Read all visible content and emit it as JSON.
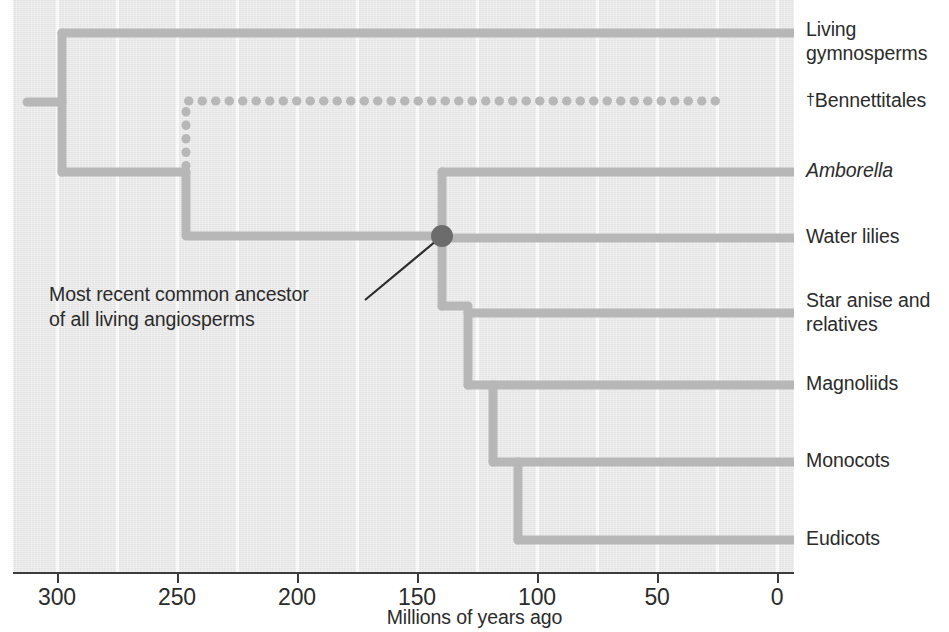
{
  "figure": {
    "type": "phylogenetic-tree-cladogram",
    "background_color": "#e9e9e9",
    "branch_color": "#b7b7b7",
    "node_color": "#6c6c6c",
    "text_color": "#2b2b2b"
  },
  "axis": {
    "title": "Millions of years ago",
    "direction": "right-to-left",
    "ticks": [
      {
        "label": "300",
        "value": 300,
        "x": 57
      },
      {
        "label": "250",
        "value": 250,
        "x": 177
      },
      {
        "label": "200",
        "value": 200,
        "x": 297
      },
      {
        "label": "150",
        "value": 150,
        "x": 417
      },
      {
        "label": "100",
        "value": 100,
        "x": 537
      },
      {
        "label": "50",
        "value": 50,
        "x": 657
      },
      {
        "label": "0",
        "value": 0,
        "x": 777
      }
    ],
    "gridline_x": [
      57,
      117,
      177,
      237,
      297,
      357,
      417,
      477,
      537,
      597,
      657,
      717,
      777
    ]
  },
  "taxa": [
    {
      "name": "Living gymnosperms",
      "lines": [
        "Living",
        "gymnosperms"
      ],
      "italic": false,
      "extinct": false,
      "label_top": 18,
      "tip_y": 33
    },
    {
      "name": "Bennettitales",
      "lines": [
        "Bennettitales"
      ],
      "italic": false,
      "extinct": true,
      "label_top": 88,
      "tip_y": 101
    },
    {
      "name": "Amborella",
      "lines": [
        "Amborella"
      ],
      "italic": true,
      "extinct": false,
      "label_top": 159,
      "tip_y": 172
    },
    {
      "name": "Water lilies",
      "lines": [
        "Water lilies"
      ],
      "italic": false,
      "extinct": false,
      "label_top": 225,
      "tip_y": 238
    },
    {
      "name": "Star anise and relatives",
      "lines": [
        "Star anise and",
        "relatives"
      ],
      "italic": false,
      "extinct": false,
      "label_top": 289,
      "tip_y": 313
    },
    {
      "name": "Magnoliids",
      "lines": [
        "Magnoliids"
      ],
      "italic": false,
      "extinct": false,
      "label_top": 372,
      "tip_y": 385
    },
    {
      "name": "Monocots",
      "lines": [
        "Monocots"
      ],
      "italic": false,
      "extinct": false,
      "label_top": 449,
      "tip_y": 462
    },
    {
      "name": "Eudicots",
      "lines": [
        "Eudicots"
      ],
      "italic": false,
      "extinct": false,
      "label_top": 527,
      "tip_y": 540
    }
  ],
  "annotation": {
    "text": "Most recent common ancestor of all living angiosperms",
    "line1": "Most recent common ancestor",
    "line2": "of all living angiosperms"
  },
  "node_marker": {
    "name": "most-recent-common-ancestor-of-living-angiosperms",
    "x": 429,
    "y": 236,
    "radius": 11,
    "age_mya": 155
  },
  "chart_data": {
    "type": "tree",
    "title": "",
    "xlabel": "Millions of years ago",
    "ylabel": "",
    "xlim": [
      330,
      0
    ],
    "grid": true,
    "legend": "none",
    "tip_labels": [
      "Living gymnosperms",
      "†Bennettitales",
      "Amborella",
      "Water lilies",
      "Star anise and relatives",
      "Magnoliids",
      "Monocots",
      "Eudicots"
    ],
    "nodes": [
      {
        "name": "root-split-seed-plants",
        "age_mya": 325,
        "children": [
          "Living gymnosperms",
          "angiosperm-bennettitales-clade"
        ]
      },
      {
        "name": "angiosperm-bennettitales-clade",
        "age_mya": 250,
        "children": [
          "†Bennettitales",
          "crown-angiosperms"
        ],
        "dashed_child": "†Bennettitales"
      },
      {
        "name": "crown-angiosperms",
        "age_mya": 155,
        "children": [
          "Amborella",
          "post-amborella"
        ],
        "marked": true
      },
      {
        "name": "post-amborella",
        "age_mya": 150,
        "children": [
          "Water lilies",
          "post-waterlilies"
        ]
      },
      {
        "name": "post-waterlilies",
        "age_mya": 140,
        "children": [
          "Star anise and relatives",
          "post-staranise"
        ]
      },
      {
        "name": "post-staranise",
        "age_mya": 135,
        "children": [
          "Magnoliids",
          "monocots-eudicots"
        ]
      },
      {
        "name": "monocots-eudicots",
        "age_mya": 128,
        "children": [
          "Monocots",
          "Eudicots"
        ]
      }
    ],
    "extinct_lineage": {
      "name": "†Bennettitales",
      "style": "dotted",
      "extinction_age_mya": 30
    }
  }
}
